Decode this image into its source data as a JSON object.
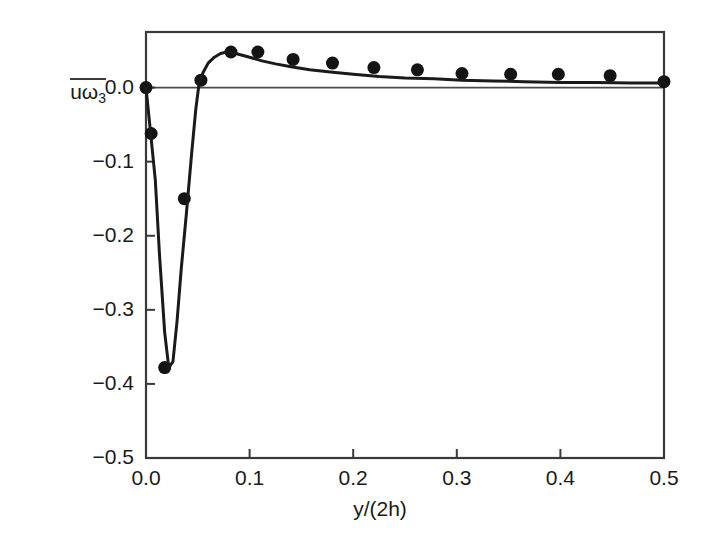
{
  "figure": {
    "background_color": "#ffffff",
    "foreground_color": "#1a1a1a",
    "line_color": "#1a1a1a",
    "marker_color": "#141414",
    "axis_color": "#3a3a3a",
    "zero_line_color": "#4a4a4a"
  },
  "chart_data": {
    "type": "scatter",
    "title": "",
    "subtitle": "",
    "xlabel": "y/(2h)",
    "ylabel": "uω3",
    "ylabel_parts": {
      "base": "uω",
      "subscript": "3",
      "overbar": true
    },
    "xlim": [
      0.0,
      0.5
    ],
    "ylim": [
      -0.5,
      0.075
    ],
    "xticks": [
      0.0,
      0.1,
      0.2,
      0.3,
      0.4,
      0.5
    ],
    "xtick_labels": [
      "0.0",
      "0.1",
      "0.2",
      "0.3",
      "0.4",
      "0.5"
    ],
    "yticks": [
      0.0,
      -0.1,
      -0.2,
      -0.3,
      -0.4,
      -0.5
    ],
    "ytick_labels": [
      "0.0",
      "-0.1",
      "-0.2",
      "-0.3",
      "-0.4",
      "-0.5"
    ],
    "grid": false,
    "legend": null,
    "legend_position": "none",
    "zero_line": {
      "value": 0.0,
      "visible": true
    },
    "series": [
      {
        "name": "DNS data",
        "kind": "scatter",
        "marker": "filled-circle",
        "marker_size": 13,
        "x": [
          0.0,
          0.005,
          0.018,
          0.037,
          0.053,
          0.082,
          0.108,
          0.142,
          0.18,
          0.22,
          0.262,
          0.305,
          0.352,
          0.398,
          0.448,
          0.5
        ],
        "y": [
          0.0,
          -0.062,
          -0.378,
          -0.15,
          0.01,
          0.048,
          0.048,
          0.038,
          0.033,
          0.027,
          0.024,
          0.019,
          0.018,
          0.018,
          0.016,
          0.008
        ]
      },
      {
        "name": "Model prediction",
        "kind": "line",
        "linewidth": 3,
        "x": [
          0.0,
          0.004,
          0.009,
          0.013,
          0.018,
          0.022,
          0.026,
          0.03,
          0.034,
          0.039,
          0.044,
          0.048,
          0.051,
          0.055,
          0.06,
          0.066,
          0.072,
          0.078,
          0.084,
          0.092,
          0.1,
          0.112,
          0.125,
          0.14,
          0.158,
          0.178,
          0.2,
          0.225,
          0.25,
          0.278,
          0.305,
          0.335,
          0.365,
          0.4,
          0.435,
          0.468,
          0.5
        ],
        "y": [
          0.0,
          -0.055,
          -0.125,
          -0.225,
          -0.33,
          -0.378,
          -0.37,
          -0.315,
          -0.245,
          -0.17,
          -0.09,
          -0.03,
          0.003,
          0.02,
          0.033,
          0.041,
          0.046,
          0.048,
          0.047,
          0.044,
          0.041,
          0.036,
          0.032,
          0.028,
          0.024,
          0.021,
          0.018,
          0.015,
          0.013,
          0.012,
          0.01,
          0.009,
          0.008,
          0.007,
          0.007,
          0.006,
          0.006
        ]
      }
    ]
  },
  "plot_box": {
    "left": 146,
    "top": 32,
    "right": 664,
    "bottom": 458
  }
}
